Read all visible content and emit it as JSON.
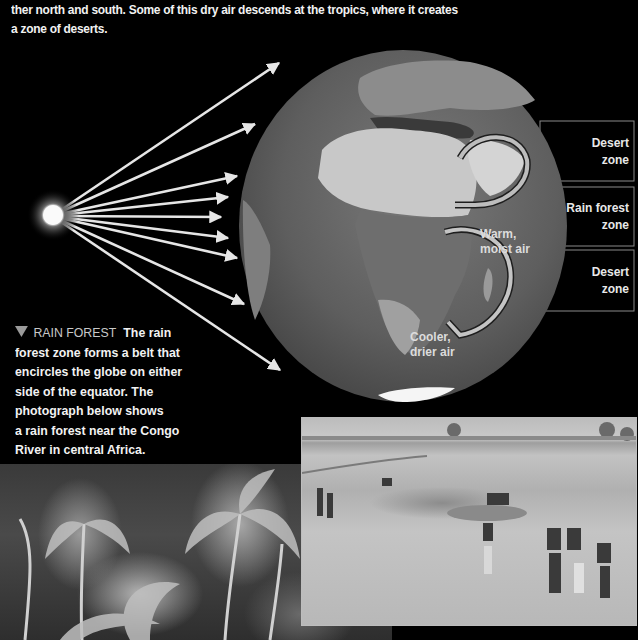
{
  "intro_text": {
    "line1": "ther north and south.  Some of this dry air descends at the tropics,  where it creates",
    "line2": "a zone of deserts."
  },
  "diagram": {
    "sun": {
      "label": "sun-glow"
    },
    "rays_count": 9,
    "globe_labels": {
      "warm_line1": "Warm,",
      "warm_line2": "moist air",
      "cool_line1": "Cooler,",
      "cool_line2": "drier air"
    },
    "zones": [
      {
        "line1": "Desert",
        "line2": "zone"
      },
      {
        "line1": "Rain forest",
        "line2": "zone"
      },
      {
        "line1": "Desert",
        "line2": "zone"
      }
    ]
  },
  "caption": {
    "heading": "RAIN FOREST",
    "lines": [
      "The rain",
      "forest zone forms a belt that",
      "encircles the globe on either",
      "side of the equator. The",
      "photograph below shows",
      "a rain forest near the Congo",
      "River in central Africa."
    ]
  },
  "photos": {
    "forest": "rain-forest-photo",
    "desert": "desert-river-photo"
  }
}
